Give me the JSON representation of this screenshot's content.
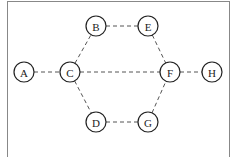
{
  "diagram": {
    "type": "graph",
    "nodes": [
      {
        "id": "A",
        "label": "A",
        "x": 24,
        "y": 72
      },
      {
        "id": "B",
        "label": "B",
        "x": 96,
        "y": 26
      },
      {
        "id": "C",
        "label": "C",
        "x": 70,
        "y": 72
      },
      {
        "id": "D",
        "label": "D",
        "x": 96,
        "y": 122
      },
      {
        "id": "E",
        "label": "E",
        "x": 148,
        "y": 26
      },
      {
        "id": "F",
        "label": "F",
        "x": 170,
        "y": 72
      },
      {
        "id": "G",
        "label": "G",
        "x": 148,
        "y": 122
      },
      {
        "id": "H",
        "label": "H",
        "x": 212,
        "y": 72
      }
    ],
    "edges": [
      [
        "A",
        "C"
      ],
      [
        "C",
        "B"
      ],
      [
        "B",
        "E"
      ],
      [
        "E",
        "F"
      ],
      [
        "C",
        "F"
      ],
      [
        "F",
        "H"
      ],
      [
        "C",
        "D"
      ],
      [
        "D",
        "G"
      ],
      [
        "G",
        "F"
      ]
    ],
    "edge_style": "dashed",
    "node_radius": 10
  }
}
